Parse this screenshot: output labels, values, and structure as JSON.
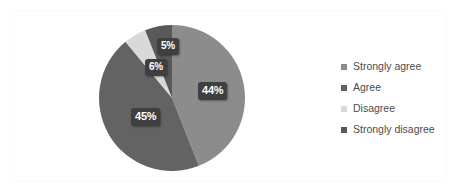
{
  "chart_data": {
    "type": "pie",
    "title": "",
    "categories": [
      "Strongly agree",
      "Agree",
      "Disagree",
      "Strongly disagree"
    ],
    "values": [
      44,
      45,
      5,
      6
    ],
    "labels": [
      "44%",
      "45%",
      "5%",
      "6%"
    ],
    "colors": [
      "#8c8c8c",
      "#636363",
      "#d9d9d9",
      "#595959"
    ],
    "legend_position": "right",
    "grid": false,
    "start_angle_deg": 0,
    "direction": "clockwise",
    "slices": [
      {
        "name": "Strongly agree",
        "value": 44,
        "label": "44%",
        "color": "#8c8c8c"
      },
      {
        "name": "Agree",
        "value": 45,
        "label": "45%",
        "color": "#636363"
      },
      {
        "name": "Disagree",
        "value": 5,
        "label": "5%",
        "color": "#d9d9d9"
      },
      {
        "name": "Strongly disagree",
        "value": 6,
        "label": "6%",
        "color": "#595959"
      }
    ]
  },
  "legend": {
    "items": [
      {
        "label": "Strongly agree",
        "marker": "square-marker-icon",
        "color": "#8c8c8c"
      },
      {
        "label": "Agree",
        "marker": "square-marker-icon",
        "color": "#636363"
      },
      {
        "label": "Disagree",
        "marker": "square-marker-icon",
        "color": "#d9d9d9"
      },
      {
        "label": "Strongly disagree",
        "marker": "square-marker-icon",
        "color": "#595959"
      }
    ]
  },
  "labels": {
    "strongly_agree": "44%",
    "agree": "45%",
    "disagree": "5%",
    "strongly_disagree": "6%"
  }
}
